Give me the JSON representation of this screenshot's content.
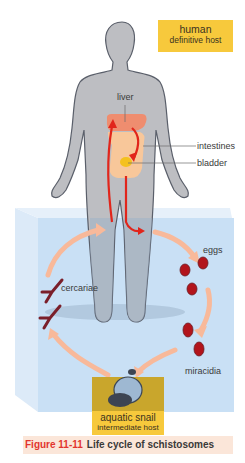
{
  "diagram": {
    "title": "Life cycle of schistosomes",
    "hosts": {
      "definitive": {
        "name": "human",
        "role": "definitive host"
      },
      "intermediate": {
        "name": "aquatic snail",
        "role": "intermediate host"
      }
    },
    "organ_labels": {
      "liver": "liver",
      "intestines": "intestines",
      "bladder": "bladder"
    },
    "stage_labels": {
      "eggs": "eggs",
      "miracidia": "miracidia",
      "cercariae": "cercariae"
    },
    "caption": {
      "figure_number": "Figure 11-11",
      "text": "Life cycle of schistosomes"
    },
    "colors": {
      "host_box": "#f7c93c",
      "water": "#c9e0f5",
      "body": "#bdbec2",
      "cycle_arrow": "#f8b99a",
      "blood_arrow": "#e1251b",
      "liver": "#ef8d6f",
      "intestine": "#f8c79a",
      "bladder": "#f4c11f",
      "egg": "#b2141b",
      "caption_bg": "#fbe6d9",
      "caption_fig": "#e2352e"
    }
  }
}
